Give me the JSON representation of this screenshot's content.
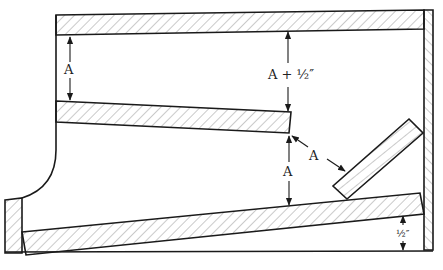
{
  "figure": {
    "type": "cross-section diagram"
  },
  "labels": {
    "top_gap": "A",
    "upper_right_gap": "A + ½″",
    "lower_middle_gap": "A",
    "diagonal_gap": "A",
    "bottom_right_gap": "½″"
  },
  "colors": {
    "line": "#1a1a1a",
    "hatch": "#8a8a8a",
    "background": "#ffffff"
  },
  "components": [
    {
      "name": "top-shelf",
      "hatched": true
    },
    {
      "name": "right-wall",
      "hatched": true
    },
    {
      "name": "middle-shelf",
      "hatched": true
    },
    {
      "name": "angled-board",
      "hatched": true
    },
    {
      "name": "bottom-board",
      "hatched": true
    },
    {
      "name": "left-post",
      "hatched": true
    },
    {
      "name": "left-wall-curve",
      "hatched": false
    },
    {
      "name": "base-line",
      "hatched": false
    }
  ]
}
